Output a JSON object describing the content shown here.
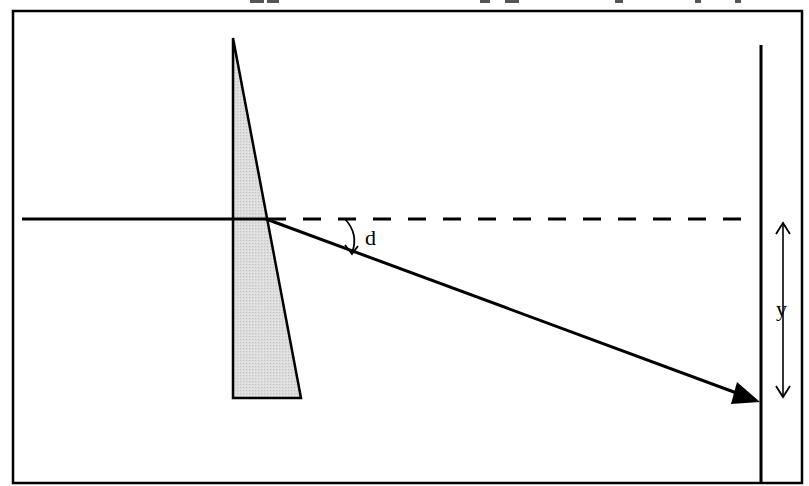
{
  "diagram": {
    "labels": {
      "deviation_angle": "d",
      "displacement": "y"
    },
    "elements": {
      "prism": {
        "shape": "right-triangle wedge",
        "fill": "#d9d9d9",
        "stroke": "#000000"
      },
      "incident_ray": {
        "style": "solid"
      },
      "undeviated_path": {
        "style": "dashed"
      },
      "deviated_ray": {
        "style": "solid",
        "arrowhead": "filled"
      },
      "screen": {
        "style": "solid vertical line"
      },
      "displacement_arrow": {
        "style": "double-headed open arrow"
      }
    },
    "colors": {
      "stroke": "#000000",
      "prism_fill": "#d9d9d9",
      "background": "#ffffff"
    }
  }
}
